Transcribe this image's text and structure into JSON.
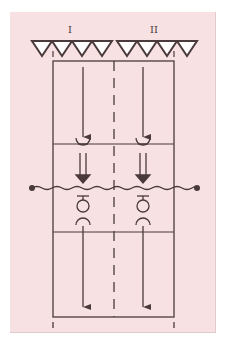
{
  "diagram": {
    "type": "two-column schematic with arrows, coupling symbols and a wavy cross line",
    "background_color": "#f7e1e2",
    "line_color": "#4a3a3c",
    "column_labels": [
      "I",
      "II"
    ],
    "top_triangle_rows": [
      {
        "column": "I",
        "count": 4
      },
      {
        "column": "II",
        "count": 4
      }
    ],
    "sections": [
      {
        "name": "upper",
        "content": "downward single-line arrows ending on half-circle cup symbols"
      },
      {
        "name": "middle",
        "content": "double-line downward arrows crossing a wavy line, followed by bar + circle + half-circle symbols"
      },
      {
        "name": "lower",
        "content": "downward single-line arrows"
      }
    ],
    "wavy_line": {
      "endpoints": "filled dots at both ends"
    },
    "center_divider": "dashed vertical line"
  }
}
